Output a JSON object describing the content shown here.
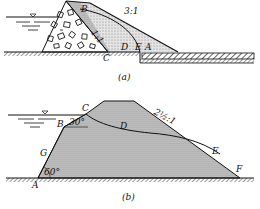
{
  "figure_a": {
    "caption": "(a)",
    "slope_downstream": "3:1",
    "slope_core": "1:1",
    "points": {
      "A": "A",
      "B": "B",
      "C": "C",
      "D": "D",
      "E": "E"
    }
  },
  "figure_b": {
    "caption": "(b)",
    "slope_downstream": "2½:1",
    "angle_upstream_toe": "60°",
    "angle_at_B": "30°",
    "points": {
      "A": "A",
      "B": "B",
      "C": "C",
      "D": "D",
      "E": "E",
      "F": "F",
      "G": "G"
    }
  },
  "colors": {
    "ink": "#111111",
    "fill": "#d6d6d6",
    "background": "#ffffff"
  }
}
